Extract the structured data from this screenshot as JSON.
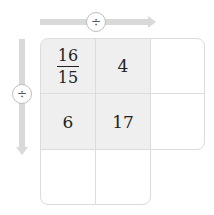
{
  "operators": {
    "horizontal": "÷",
    "vertical": "÷"
  },
  "grid": {
    "cells": [
      {
        "row": 0,
        "col": 0,
        "numerator": "16",
        "denominator": "15",
        "shaded": true
      },
      {
        "row": 0,
        "col": 1,
        "value": "4",
        "shaded": true
      },
      {
        "row": 0,
        "col": 2,
        "value": "",
        "shaded": false
      },
      {
        "row": 1,
        "col": 0,
        "value": "6",
        "shaded": true
      },
      {
        "row": 1,
        "col": 1,
        "value": "17",
        "shaded": true
      },
      {
        "row": 1,
        "col": 2,
        "value": "",
        "shaded": false
      },
      {
        "row": 2,
        "col": 0,
        "value": "",
        "shaded": false
      },
      {
        "row": 2,
        "col": 1,
        "value": "",
        "shaded": false
      }
    ]
  },
  "colors": {
    "shade": "#efefef",
    "border": "#dcdcdc",
    "arrow": "#d9d9d9"
  }
}
